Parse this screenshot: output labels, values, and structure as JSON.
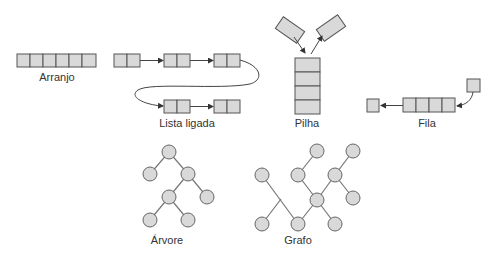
{
  "colors": {
    "cell_fill": "#d9d9d9",
    "cell_stroke": "#555555",
    "edge": "#777777",
    "label": "#333333",
    "background": "#ffffff"
  },
  "labels": {
    "array": "Arranjo",
    "linked_list": "Lista ligada",
    "stack": "Pilha",
    "queue": "Fila",
    "tree": "Árvore",
    "graph": "Grafo"
  },
  "structures": {
    "array": {
      "cells": 6
    },
    "linked_list": {
      "nodes": 5,
      "fields_per_node": 2
    },
    "stack": {
      "cells": 4,
      "floating_items": 2
    },
    "queue": {
      "cells": 4,
      "enqueue_item": 1,
      "dequeue_item": 1
    },
    "tree": {
      "nodes": 7
    },
    "graph": {
      "nodes": 10
    }
  }
}
